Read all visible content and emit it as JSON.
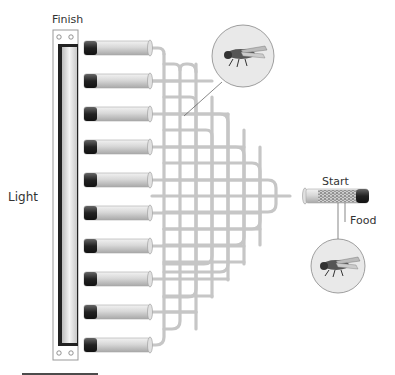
{
  "labels": {
    "finish": "Finish",
    "light": "Light",
    "start": "Start",
    "food": "Food"
  },
  "diagram": {
    "type": "fly phototaxis maze apparatus",
    "end_tube_count": 10,
    "components": [
      "light source (fluorescent tube)",
      "finish collection tubes",
      "branching choice maze",
      "start tube with flies",
      "food plug",
      "fly magnification callouts"
    ],
    "colors": {
      "channel": "#c8c8c8",
      "tube_body": "#d6d6d6",
      "tube_cap": "#2a2a2a",
      "light_frame_border": "#222222",
      "callout_fill": "#e8e8e8"
    }
  }
}
